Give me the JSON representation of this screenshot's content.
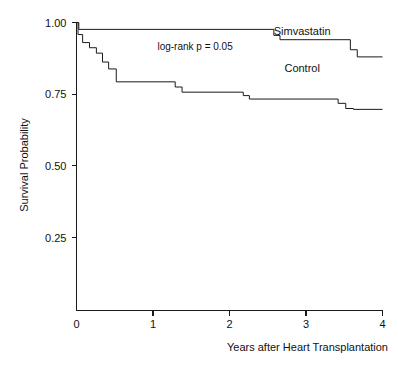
{
  "chart_data": {
    "type": "line",
    "subtype": "kaplan-meier-step",
    "title": "",
    "xlabel": "Years after Heart Transplantation",
    "ylabel": "Survival Probability",
    "xlim": [
      0,
      4
    ],
    "ylim": [
      0.15,
      1.0
    ],
    "grid": false,
    "legend_position": "inline-right",
    "xticks": [
      0,
      1,
      2,
      3,
      4
    ],
    "xtick_labels": [
      "0",
      "1",
      "2",
      "3",
      "4"
    ],
    "yticks": [
      0.25,
      0.5,
      0.75,
      1.0
    ],
    "ytick_labels": [
      "0.25",
      "0.50",
      "0.75",
      "1.00"
    ],
    "annotations": [
      {
        "name": "log-rank-p",
        "text": "log-rank p = 0.05",
        "x": 1.55,
        "y": 0.905
      }
    ],
    "series": [
      {
        "name": "Simvastatin",
        "label": "Simvastatin",
        "label_x": 2.95,
        "label_y": 0.955,
        "color": "#1a1a1a",
        "points": [
          [
            0.0,
            1.0
          ],
          [
            0.03,
            1.0
          ],
          [
            0.03,
            0.976
          ],
          [
            2.58,
            0.976
          ],
          [
            2.58,
            0.955
          ],
          [
            2.66,
            0.955
          ],
          [
            2.66,
            0.94
          ],
          [
            3.58,
            0.94
          ],
          [
            3.58,
            0.905
          ],
          [
            3.67,
            0.905
          ],
          [
            3.67,
            0.88
          ],
          [
            4.0,
            0.88
          ]
        ]
      },
      {
        "name": "Control",
        "label": "Control",
        "label_x": 2.95,
        "label_y": 0.828,
        "color": "#1a1a1a",
        "points": [
          [
            0.0,
            1.0
          ],
          [
            0.02,
            1.0
          ],
          [
            0.02,
            0.958
          ],
          [
            0.08,
            0.958
          ],
          [
            0.08,
            0.93
          ],
          [
            0.17,
            0.93
          ],
          [
            0.17,
            0.912
          ],
          [
            0.26,
            0.912
          ],
          [
            0.26,
            0.893
          ],
          [
            0.34,
            0.893
          ],
          [
            0.34,
            0.862
          ],
          [
            0.42,
            0.862
          ],
          [
            0.42,
            0.838
          ],
          [
            0.52,
            0.838
          ],
          [
            0.52,
            0.793
          ],
          [
            1.29,
            0.793
          ],
          [
            1.29,
            0.775
          ],
          [
            1.38,
            0.775
          ],
          [
            1.38,
            0.757
          ],
          [
            2.18,
            0.757
          ],
          [
            2.18,
            0.745
          ],
          [
            2.26,
            0.745
          ],
          [
            2.26,
            0.733
          ],
          [
            3.42,
            0.733
          ],
          [
            3.42,
            0.718
          ],
          [
            3.52,
            0.718
          ],
          [
            3.52,
            0.7
          ],
          [
            3.62,
            0.7
          ],
          [
            3.62,
            0.697
          ],
          [
            4.0,
            0.697
          ]
        ]
      }
    ]
  },
  "axes": {
    "x_axis_title": "Years after Heart Transplantation",
    "y_axis_title": "Survival Probability"
  }
}
